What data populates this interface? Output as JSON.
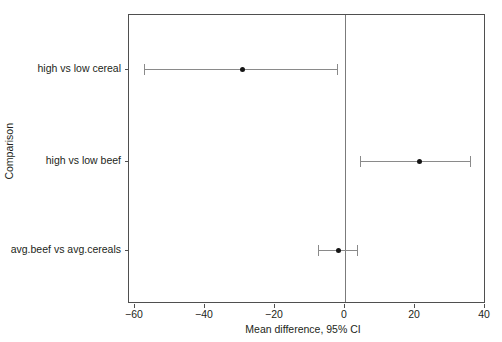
{
  "chart_data": {
    "type": "scatter",
    "subtype": "forest-plot",
    "title": "",
    "xlabel": "Mean difference, 95% CI",
    "ylabel": "Comparison",
    "xlim": [
      -68,
      40
    ],
    "xticks": [
      -60,
      -40,
      -20,
      0,
      20,
      40
    ],
    "xticklabels": [
      "−60",
      "−40",
      "−20",
      "0",
      "20",
      "40"
    ],
    "grid": false,
    "legend": null,
    "reference_line": 0,
    "categories": [
      "high vs low cereal",
      "high vs low beef",
      "avg.beef vs avg.cereals"
    ],
    "points": [
      {
        "label": "high vs low cereal",
        "estimate": -29.5,
        "ci_low": -57.5,
        "ci_high": -2.3
      },
      {
        "label": "high vs low beef",
        "estimate": 21.0,
        "ci_low": 4.3,
        "ci_high": 35.7
      },
      {
        "label": "avg.beef vs avg.cereals",
        "estimate": -2.0,
        "ci_low": -7.7,
        "ci_high": 3.4
      }
    ],
    "colors": {
      "point": "#151515",
      "interval": "#8a8a8a",
      "reference_line": "#7b7b7b",
      "frame": "#4f4f4f",
      "background": "#ffffff",
      "text": "#231f20"
    }
  }
}
